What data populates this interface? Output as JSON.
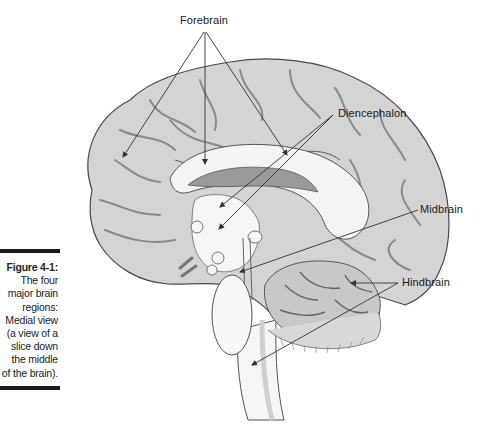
{
  "figure": {
    "number": "Figure 4-1:",
    "caption_lines": [
      "The four",
      "major brain",
      "regions:",
      "Medial view",
      "(a view of a",
      "slice down",
      "the middle",
      "of the brain)."
    ],
    "caption_full": "The four major brain regions: Medial view (a view of a slice down the middle of the brain)."
  },
  "labels": {
    "forebrain": "Forebrain",
    "diencephalon": "Diencephalon",
    "midbrain": "Midbrain",
    "hindbrain": "Hindbrain"
  },
  "colors": {
    "cortex_fill": "#d4d4d4",
    "cortex_stroke": "#4a4a4a",
    "sulcus": "#8a8a8a",
    "white_matter": "#f4f4f4",
    "ventricle": "#9a9a9a",
    "cerebellum_fill": "#c8c8c8",
    "leader_line": "#333333",
    "caption_rule": "#1a1a1a"
  }
}
